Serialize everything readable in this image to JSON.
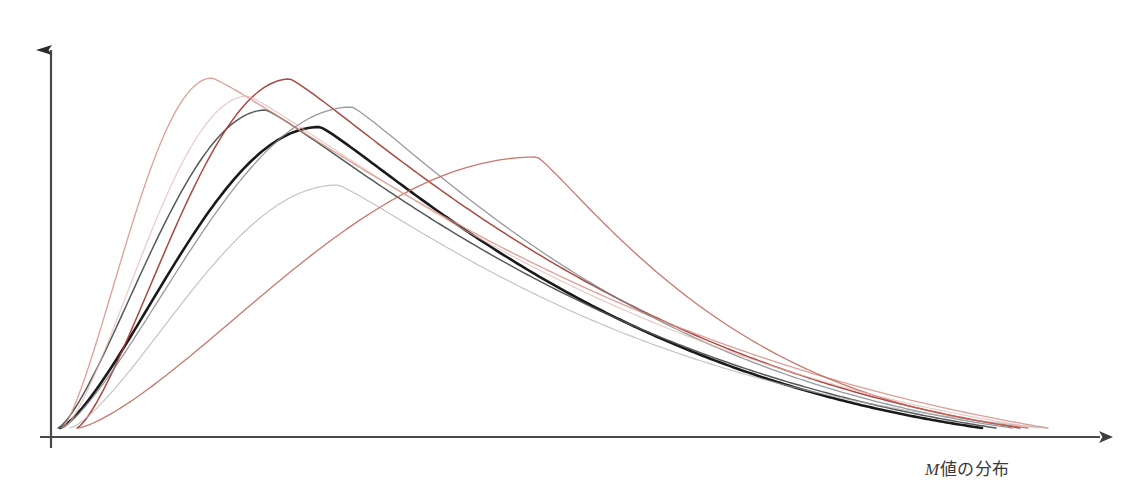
{
  "figure": {
    "background_color": "#ffffff",
    "axis_color": "#3f3f3f"
  },
  "axes": {
    "x_axis": {
      "name": "x-axis",
      "label": "M値の分布",
      "label_italic_prefix": "M",
      "label_rest": "値の分布",
      "origin_px": [
        51,
        437
      ],
      "end_px": [
        1115,
        437
      ],
      "arrowhead": true
    },
    "y_axis": {
      "name": "y-axis",
      "label": "",
      "origin_px": [
        51,
        448
      ],
      "end_px": [
        51,
        42
      ],
      "arrowhead": true
    }
  },
  "chart_data": {
    "type": "line",
    "title": "",
    "subtitle": "",
    "xlabel": "M値の分布",
    "ylabel": "",
    "xlim": [
      0,
      1123
    ],
    "ylim": [
      0,
      1
    ],
    "grid": false,
    "legend": false,
    "legend_position": "none",
    "annotations": [],
    "series": [
      {
        "name": "curve-bold-black",
        "color": "#1a1a1a",
        "width": 2.6,
        "opacity": 1.0,
        "peak_x": 320,
        "peak_y_px": 127,
        "start_x": 60,
        "end_x": 982,
        "peak_height_rel": 0.79,
        "skew": 0.62,
        "spread": 1.0,
        "emphasis": "primary"
      },
      {
        "name": "curve-dark-gray",
        "color": "#4a5250",
        "width": 1.5,
        "opacity": 0.95,
        "peak_x": 266,
        "peak_y_px": 110,
        "start_x": 58,
        "end_x": 996,
        "peak_height_rel": 0.83,
        "skew": 0.58,
        "spread": 0.96
      },
      {
        "name": "curve-dark-red",
        "color": "#a33a33",
        "width": 1.5,
        "opacity": 0.92,
        "peak_x": 290,
        "peak_y_px": 79,
        "start_x": 77,
        "end_x": 1020,
        "peak_height_rel": 0.91,
        "skew": 0.6,
        "spread": 1.02
      },
      {
        "name": "curve-light-pink",
        "color": "#d98d86",
        "width": 1.3,
        "opacity": 0.85,
        "peak_x": 212,
        "peak_y_px": 78,
        "start_x": 62,
        "end_x": 1048,
        "peak_height_rel": 0.91,
        "skew": 0.52,
        "spread": 0.95
      },
      {
        "name": "curve-mid-gray",
        "color": "#7d7f86",
        "width": 1.3,
        "opacity": 0.8,
        "peak_x": 352,
        "peak_y_px": 107,
        "start_x": 60,
        "end_x": 1012,
        "peak_height_rel": 0.84,
        "skew": 0.66,
        "spread": 1.08
      },
      {
        "name": "curve-faint-gray",
        "color": "#a9abb1",
        "width": 1.2,
        "opacity": 0.7,
        "peak_x": 338,
        "peak_y_px": 185,
        "start_x": 70,
        "end_x": 1046,
        "peak_height_rel": 0.64,
        "skew": 0.7,
        "spread": 1.22
      },
      {
        "name": "curve-salmon-right",
        "color": "#c4645a",
        "width": 1.3,
        "opacity": 0.88,
        "peak_x": 537,
        "peak_y_px": 157,
        "start_x": 78,
        "end_x": 1028,
        "peak_height_rel": 0.7,
        "skew": 0.8,
        "spread": 1.45
      },
      {
        "name": "curve-pale-rose",
        "color": "#e2b3ad",
        "width": 1.2,
        "opacity": 0.7,
        "peak_x": 248,
        "peak_y_px": 96,
        "start_x": 64,
        "end_x": 1038,
        "peak_height_rel": 0.87,
        "skew": 0.56,
        "spread": 1.0
      }
    ]
  }
}
